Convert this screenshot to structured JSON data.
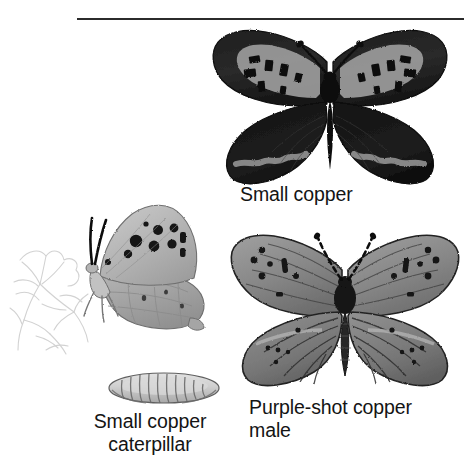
{
  "page": {
    "background_color": "#ffffff",
    "width": 464,
    "height": 463,
    "divider_color": "#2b2b2b"
  },
  "captions": {
    "small_copper": "Small copper",
    "small_copper_caterpillar": "Small copper\ncaterpillar",
    "purple_shot_copper_male": "Purple-shot copper\nmale"
  },
  "figures": [
    {
      "id": "small-copper-adult",
      "label": "Small copper",
      "view": "dorsal-spread",
      "palette": {
        "wing_dark": "#1c1c1c",
        "wing_mid": "#4a4a4a",
        "wing_light": "#8d8d8d",
        "body": "#111111",
        "outline": "#0d0d0d"
      }
    },
    {
      "id": "small-copper-side",
      "label": "Small copper underside",
      "view": "lateral-closed-wing",
      "palette": {
        "wing_light": "#b9b9b9",
        "wing_mid": "#9a9a9a",
        "spot": "#111111",
        "outline": "#3a3a3a"
      }
    },
    {
      "id": "foodplant-sketch",
      "label": "Sorrel foodplant line sketch",
      "view": "line-drawing",
      "palette": {
        "line": "#cfcfcf"
      }
    },
    {
      "id": "small-copper-caterpillar",
      "label": "Small copper caterpillar",
      "view": "lateral",
      "palette": {
        "body_light": "#d8d8d8",
        "body_mid": "#a9a9a9",
        "outline": "#5a5a5a"
      }
    },
    {
      "id": "purple-shot-copper-male",
      "label": "Purple-shot copper male",
      "view": "dorsal-spread",
      "palette": {
        "wing_mid": "#8a8a8a",
        "wing_dark": "#5c5c5c",
        "wing_light": "#a6a6a6",
        "spot": "#141414",
        "body": "#161616",
        "outline": "#1a1a1a"
      }
    }
  ]
}
